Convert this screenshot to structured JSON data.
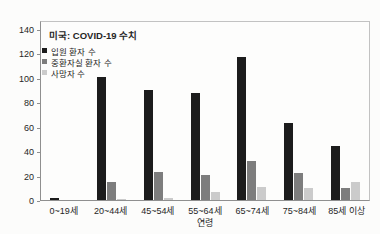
{
  "colors": {
    "hospitalized_bar": "#1c1c1c",
    "icu_bar": "#7d7d7d",
    "deaths_bar": "#cbcbcb",
    "axis": "#8f8f8f",
    "plot_border": "#c2c2c2",
    "text": "#262626"
  },
  "chart_data": {
    "type": "bar",
    "title": "미국: COVID-19 수치",
    "xlabel": "연령",
    "ylabel": "",
    "categories": [
      "0~19세",
      "20~44세",
      "45~54세",
      "55~64세",
      "65~74세",
      "75~84세",
      "85세 이상"
    ],
    "series": [
      {
        "key": "hospitalized",
        "name": "입원 환자 수",
        "color": "#1c1c1c",
        "values": [
          2,
          102,
          91,
          88,
          118,
          64,
          45
        ]
      },
      {
        "key": "icu",
        "name": "중환자실 환자 수",
        "color": "#7d7d7d",
        "values": [
          0,
          15,
          23,
          21,
          32,
          22,
          10
        ]
      },
      {
        "key": "deaths",
        "name": "사망자 수",
        "color": "#cbcbcb",
        "values": [
          0,
          1,
          2,
          7,
          11,
          10,
          15
        ]
      }
    ],
    "ylim": [
      0,
      147
    ],
    "yticks": [
      0,
      20,
      40,
      60,
      80,
      100,
      120,
      140
    ],
    "grid": false,
    "legend_position": "top-left-inside"
  }
}
